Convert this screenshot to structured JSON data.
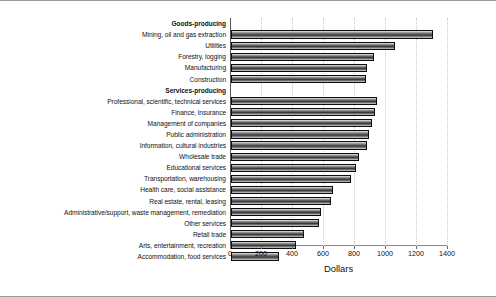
{
  "chart_data": {
    "type": "bar",
    "orientation": "horizontal",
    "title": "",
    "xlabel": "Dollars",
    "ylabel": "",
    "xlim": [
      0,
      1400
    ],
    "xticks": [
      0,
      200,
      400,
      600,
      800,
      1000,
      1200,
      1400
    ],
    "grid": "vertical-dotted",
    "legend": "none",
    "categories": [
      "Goods-producing",
      "Mining, oil and gas extraction",
      "Utilities",
      "Forestry, logging",
      "Manufacturing",
      "Construction",
      "Services-producing",
      "Professional, scientific, technical services",
      "Finance, insurance",
      "Management of companies",
      "Public administration",
      "Information, cultural industries",
      "Wholesale trade",
      "Educational services",
      "Transportation, warehousing",
      "Health care, social assistance",
      "Real estate, rental, leasing",
      "Administrative/support, waste management, remediation",
      "Other services",
      "Retail trade",
      "Arts, entertainment, recreation",
      "Accommodation, food services"
    ],
    "values": [
      null,
      1300,
      1060,
      920,
      880,
      870,
      null,
      945,
      930,
      910,
      890,
      875,
      825,
      805,
      775,
      655,
      645,
      580,
      565,
      470,
      420,
      310
    ],
    "header_rows": [
      0,
      6
    ],
    "bar_fill": "#4a4a4a",
    "bar_edge": "#0d0d0d"
  }
}
